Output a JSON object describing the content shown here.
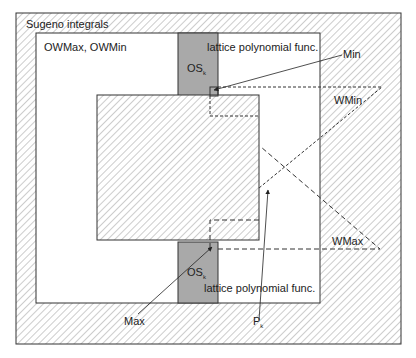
{
  "diagram": {
    "regions": {
      "outer": {
        "label": "Sugeno integrals"
      },
      "owmax": {
        "label": "OWMax, OWMin"
      },
      "lattice_top": {
        "label": "lattice polynomial func."
      },
      "lattice_bottom": {
        "label": "lattice polynomial func."
      },
      "os_top": {
        "label": "OS",
        "subscript": "k"
      },
      "os_bottom": {
        "label": "OS",
        "subscript": "k"
      }
    },
    "annotations": {
      "min": "Min",
      "wmin": "WMin",
      "wmax": "WMax",
      "max": "Max",
      "pk": {
        "label": "P",
        "subscript": "k"
      }
    },
    "colors": {
      "stroke": "#333333",
      "gray_fill": "#a9a9a9",
      "hatch": "#9a9a9a",
      "background": "#ffffff"
    }
  }
}
